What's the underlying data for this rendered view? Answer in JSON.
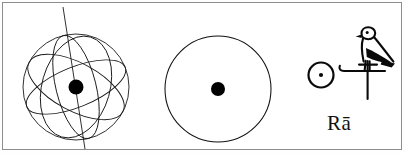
{
  "figure": {
    "caption_label": "Rā",
    "panels": [
      {
        "id": "armillary-sphere",
        "name": "armillary-sphere",
        "description": "celestial sphere with orbital rings and polar axis",
        "center_dot_label": "sun at center",
        "rings_count": 4,
        "has_axis_line": true
      },
      {
        "id": "sun-disk",
        "name": "sun-disk",
        "description": "plain circle with filled dot at center",
        "center_dot_label": "sun at center",
        "rings_count": 1,
        "has_axis_line": false
      },
      {
        "id": "hieroglyph-group",
        "name": "hieroglyph-group",
        "description": "Egyptian sun disk hieroglyph followed by falcon on standard",
        "glyphs": [
          {
            "name": "sun-disk-hieroglyph",
            "label": "sun disk with center dot"
          },
          {
            "name": "falcon-on-standard-hieroglyph",
            "label": "falcon perched on standard"
          }
        ]
      }
    ]
  },
  "colors": {
    "ink": "#0a0a0a",
    "line": "#1a1a1a",
    "frame": "#8d8d8d",
    "background": "#ffffff"
  }
}
